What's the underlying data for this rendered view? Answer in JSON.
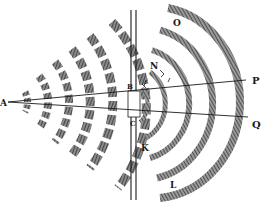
{
  "figure": {
    "labels": {
      "source": "A",
      "aperture_top": "B",
      "aperture_bottom": "C",
      "upper_near": "N",
      "upper_far": "O",
      "lower_near": "K",
      "lower_far": "L",
      "ray_upper": "P",
      "ray_lower": "Q"
    },
    "colors": {
      "ink": "#1a1a1a",
      "hatch": "#3a3a3a",
      "paper": "#ffffff"
    }
  }
}
